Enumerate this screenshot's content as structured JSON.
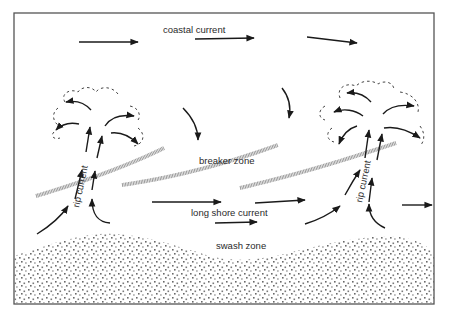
{
  "diagram": {
    "labels": {
      "coastal_current": "coastal current",
      "breaker_zone": "breaker zone",
      "long_shore_current": "long shore current",
      "swash_zone": "swash zone",
      "rip_current_left": "rip current",
      "rip_current_right": "rip current"
    },
    "colors": {
      "frame": "#555555",
      "arrows": "#1a1a1a",
      "breaker_line": "#9a9a9a",
      "sand_dots": "#6a6a6a",
      "background": "#ffffff"
    },
    "elements": [
      "frame",
      "coastal-current-arrows",
      "rip-current-left",
      "rip-current-right",
      "rip-head-dashed-outlines",
      "breaker-zone-lines",
      "long-shore-current-arrows",
      "swash-zone-sand"
    ]
  }
}
